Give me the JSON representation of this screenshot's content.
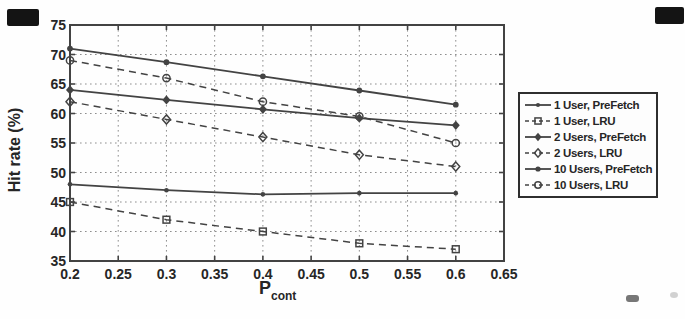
{
  "figure": {
    "background": "#fefefe",
    "ink_color": "#434343",
    "grid_color": "#8e8e8e",
    "text_color": "#262626",
    "legend_border_color": "#2e2e2e"
  },
  "chart_data": {
    "type": "line",
    "title": "",
    "xlabel_base": "P",
    "xlabel_sub": "cont",
    "ylabel": "Hit rate (%)",
    "xlim": [
      0.2,
      0.65
    ],
    "ylim": [
      35,
      75
    ],
    "x_ticks": [
      "0.2",
      "0.25",
      "0.3",
      "0.35",
      "0.4",
      "0.45",
      "0.5",
      "0.55",
      "0.6",
      "0.65"
    ],
    "y_ticks": [
      "35",
      "40",
      "45",
      "50",
      "55",
      "60",
      "65",
      "70",
      "75"
    ],
    "grid": "dotted",
    "legend_position": "outside-right",
    "x": [
      0.2,
      0.3,
      0.4,
      0.5,
      0.6
    ],
    "series": [
      {
        "name": "1 User, PreFetch",
        "line": "solid",
        "marker": "circle-filled-small",
        "values": [
          48,
          47,
          46.3,
          46.5,
          46.5
        ]
      },
      {
        "name": "1 User, LRU",
        "line": "dashed",
        "marker": "square-open",
        "values": [
          45,
          42,
          40,
          38,
          37
        ]
      },
      {
        "name": "2 Users, PreFetch",
        "line": "solid",
        "marker": "diamond-filled",
        "values": [
          64,
          62.3,
          60.7,
          59.2,
          58
        ]
      },
      {
        "name": "2 Users, LRU",
        "line": "dashed",
        "marker": "diamond-open",
        "values": [
          62,
          59,
          56,
          53,
          51
        ]
      },
      {
        "name": "10 Users, PreFetch",
        "line": "solid",
        "marker": "circle-filled",
        "values": [
          71,
          68.7,
          66.3,
          63.9,
          61.5
        ]
      },
      {
        "name": "10 Users, LRU",
        "line": "dashed",
        "marker": "circle-open",
        "values": [
          69,
          66,
          62,
          59.5,
          55
        ]
      }
    ]
  }
}
